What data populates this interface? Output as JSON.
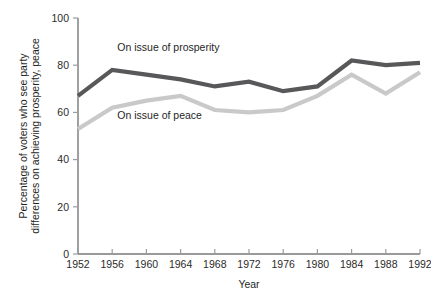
{
  "chart_data": {
    "type": "line",
    "title": "",
    "xlabel": "Year",
    "ylabel": "Percentage of voters who see party differences on achieving prosperity, peace",
    "ylabel_line1": "Percentage of voters who see party",
    "ylabel_line2": "differences on achieving prosperity, peace",
    "categories": [
      1952,
      1956,
      1960,
      1964,
      1968,
      1972,
      1976,
      1980,
      1984,
      1988,
      1992
    ],
    "x_tick_labels": [
      "1952",
      "1956",
      "1960",
      "1964",
      "1968",
      "1972",
      "1976",
      "1980",
      "1984",
      "1988",
      "1992"
    ],
    "y_tick_labels": [
      "0",
      "20",
      "40",
      "60",
      "80",
      "100"
    ],
    "y_ticks": [
      0,
      20,
      40,
      60,
      80,
      100
    ],
    "ylim": [
      0,
      100
    ],
    "xlim": [
      1952,
      1992
    ],
    "grid": false,
    "legend_position": "inline-annotation",
    "series": [
      {
        "name": "On issue of prosperity",
        "color": "#58585a",
        "label": "On issue of prosperity",
        "label_x": 1956.6,
        "label_y": 86,
        "values": [
          67,
          78,
          76,
          74,
          71,
          73,
          69,
          71,
          82,
          80,
          81
        ]
      },
      {
        "name": "On issue of peace",
        "color": "#c9c9c9",
        "label": "On issue of peace",
        "label_x": 1956.6,
        "label_y": 57,
        "values": [
          53,
          62,
          65,
          67,
          61,
          60,
          61,
          67,
          76,
          68,
          77
        ]
      }
    ]
  },
  "axis": {
    "axis_color": "#77787b",
    "tick_color": "#9a9b9e",
    "text_color": "#2b2b2b"
  }
}
